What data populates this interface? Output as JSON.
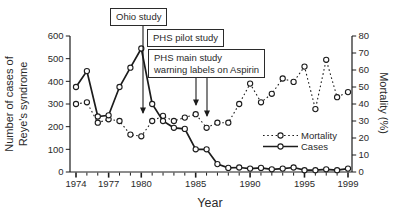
{
  "figure": {
    "y_left_label_line1": "Number of cases of",
    "y_left_label_line2": "Reye's syndrome",
    "y_right_label": "Mortality (%)",
    "x_label": "Year"
  },
  "annotations": {
    "ohio_study": "Ohio study",
    "phs_pilot_study": "PHS pilot study",
    "phs_main_line1": "PHS main study",
    "phs_main_line2": "warning labels on Aspirin"
  },
  "legend": {
    "mortality_label": "Mortality",
    "cases_label": "Cases"
  },
  "colors": {
    "line": "#1c1c1c",
    "text": "#2a2a2a",
    "background": "#ffffff",
    "box_border": "#2b2b2b"
  },
  "chart_data": {
    "type": "line",
    "title": "",
    "xlabel": "Year",
    "x": [
      1974,
      1975,
      1976,
      1977,
      1978,
      1979,
      1980,
      1981,
      1982,
      1983,
      1984,
      1985,
      1986,
      1987,
      1988,
      1989,
      1990,
      1991,
      1992,
      1993,
      1994,
      1995,
      1996,
      1997,
      1998,
      1999
    ],
    "x_tick_labels": [
      1974,
      1977,
      1980,
      1985,
      1990,
      1995,
      1999
    ],
    "left_axis": {
      "label": "Number of cases of Reye's syndrome",
      "min": 0,
      "max": 600,
      "ticks": [
        0,
        100,
        200,
        300,
        400,
        500,
        600
      ]
    },
    "right_axis": {
      "label": "Mortality (%)",
      "min": 0,
      "max": 80,
      "ticks": [
        0,
        10,
        20,
        30,
        40,
        50,
        60,
        70,
        80
      ]
    },
    "grid": false,
    "legend_position": "right-center",
    "series": [
      {
        "name": "Mortality",
        "axis": "right",
        "style": "dotted",
        "marker": "open-circle",
        "values": [
          40,
          41,
          29,
          31,
          30,
          22,
          21,
          30,
          33,
          30,
          32,
          34,
          26,
          29,
          29,
          40,
          52,
          41,
          46,
          55,
          53,
          62,
          37,
          66,
          44,
          47
        ]
      },
      {
        "name": "Cases",
        "axis": "left",
        "style": "solid",
        "marker": "open-circle",
        "values": [
          375,
          445,
          245,
          250,
          375,
          460,
          545,
          300,
          225,
          195,
          190,
          100,
          100,
          35,
          18,
          20,
          15,
          18,
          12,
          15,
          20,
          8,
          8,
          12,
          8,
          15
        ]
      }
    ],
    "event_annotations": [
      {
        "text": "Ohio study",
        "points_to_year": 1980
      },
      {
        "text": "PHS pilot study",
        "points_to_year": 1985
      },
      {
        "text": "PHS main study warning labels on Aspirin",
        "points_to_year": 1986
      }
    ]
  }
}
